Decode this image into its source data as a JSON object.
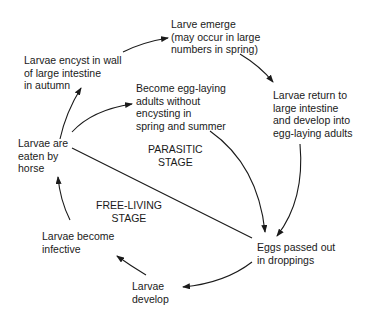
{
  "diagram": {
    "title": "",
    "type": "life-cycle",
    "nodes": [
      {
        "id": "larvae_encyst",
        "text": "Larvae encyst in wall\nof large intestine\nin autumn"
      },
      {
        "id": "larvae_emerge",
        "text": "Larve emerge\n(may occur in large\nnumbers in spring)"
      },
      {
        "id": "larvae_return",
        "text": "Larvae return to\nlarge intestine\nand develop into\negg-laying adults"
      },
      {
        "id": "become_egg_laying",
        "text": "Become egg-laying\nadults without\nencysting in\nspring and summer"
      },
      {
        "id": "larvae_eaten",
        "text": "Larvae are\neaten by\nhorse"
      },
      {
        "id": "eggs_passed",
        "text": "Eggs passed out\nin droppings"
      },
      {
        "id": "larvae_develop",
        "text": "Larvae\ndevelop"
      },
      {
        "id": "larvae_infective",
        "text": "Larvae become\ninfective"
      }
    ],
    "stages": [
      {
        "id": "parasitic",
        "text": "PARASITIC\nSTAGE"
      },
      {
        "id": "free_living",
        "text": "FREE-LIVING\nSTAGE"
      }
    ],
    "edges": [
      {
        "from": "larvae_eaten",
        "to": "larvae_encyst"
      },
      {
        "from": "larvae_encyst",
        "to": "larvae_emerge"
      },
      {
        "from": "larvae_emerge",
        "to": "larvae_return"
      },
      {
        "from": "larvae_return",
        "to": "eggs_passed"
      },
      {
        "from": "larvae_eaten",
        "to": "become_egg_laying"
      },
      {
        "from": "become_egg_laying",
        "to": "eggs_passed"
      },
      {
        "from": "eggs_passed",
        "to": "larvae_develop"
      },
      {
        "from": "larvae_develop",
        "to": "larvae_infective"
      },
      {
        "from": "larvae_infective",
        "to": "larvae_eaten"
      }
    ],
    "divider": {
      "from": "larvae_eaten",
      "to": "eggs_passed",
      "style": "line-no-arrow"
    }
  }
}
